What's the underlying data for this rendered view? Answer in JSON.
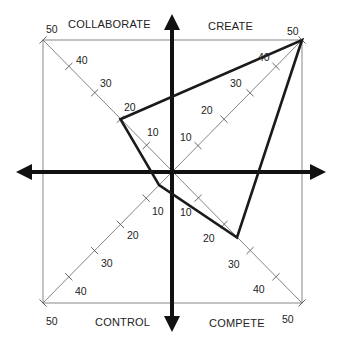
{
  "diagram": {
    "type": "competing-values-radar",
    "quadrants": {
      "top_left": "COLLABORATE",
      "top_right": "CREATE",
      "bottom_left": "CONTROL",
      "bottom_right": "COMPETE"
    },
    "scale": {
      "ticks": [
        "10",
        "20",
        "30",
        "40",
        "50"
      ],
      "max": 50
    },
    "profile": {
      "collaborate": 20,
      "create": 50,
      "compete": 25,
      "control": 5
    },
    "colors": {
      "axis": "#111111",
      "frame": "#777777",
      "profile": "#1a1a1a"
    }
  }
}
